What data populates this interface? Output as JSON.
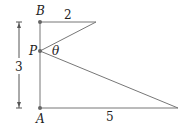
{
  "diagram": {
    "points": {
      "B": {
        "label": "B",
        "x": 40,
        "y": 22
      },
      "P": {
        "label": "P",
        "x": 40,
        "y": 51
      },
      "A": {
        "label": "A",
        "x": 40,
        "y": 108
      }
    },
    "segment_labels": {
      "top": "2",
      "bottom": "5",
      "height": "3"
    },
    "angle_label": "θ",
    "colors": {
      "line": "#777777",
      "dot": "#666666",
      "text": "#222222"
    }
  }
}
